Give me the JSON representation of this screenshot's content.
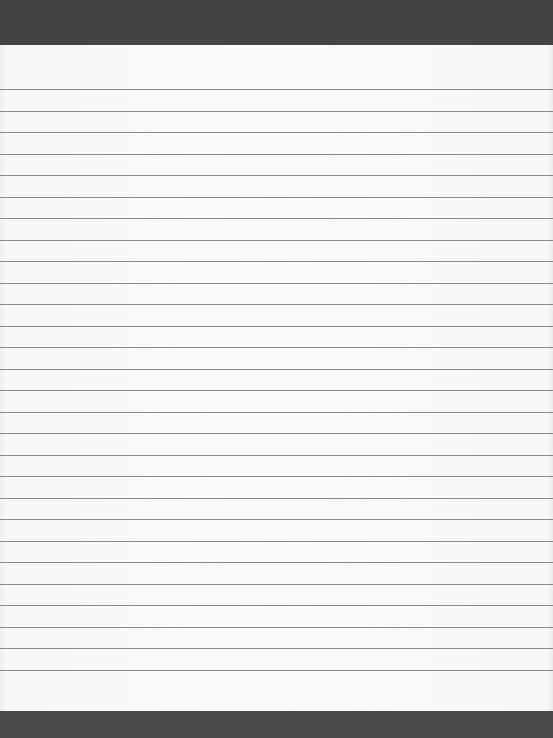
{
  "page": {
    "colors": {
      "band": "#444444",
      "paper": "#fafafa",
      "rule": "#8a8a8a"
    },
    "rules": {
      "count": 28,
      "first_y": 89,
      "spacing": 21.5
    }
  }
}
